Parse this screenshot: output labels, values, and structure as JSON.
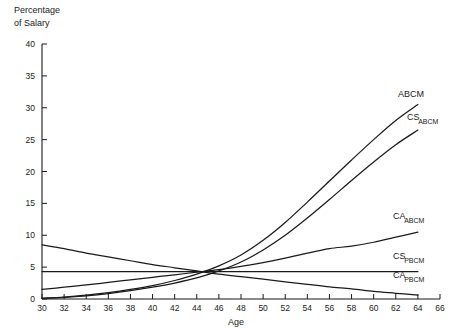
{
  "chart_data": {
    "type": "line",
    "title": "",
    "xlabel": "Age",
    "ylabel": "Percentage of Salary",
    "ylabel_line1": "Percentage",
    "ylabel_line2": "of Salary",
    "xlim": [
      30,
      66
    ],
    "ylim": [
      0,
      40
    ],
    "xticks": [
      30,
      32,
      34,
      36,
      38,
      40,
      42,
      44,
      46,
      48,
      50,
      52,
      54,
      56,
      58,
      60,
      62,
      64,
      66
    ],
    "yticks": [
      0,
      5,
      10,
      15,
      20,
      25,
      30,
      35,
      40
    ],
    "grid": false,
    "legend_position": "right-inline-labels",
    "x": [
      30,
      32,
      34,
      36,
      38,
      40,
      42,
      44,
      46,
      48,
      50,
      52,
      54,
      56,
      58,
      60,
      62,
      64
    ],
    "series": [
      {
        "name": "ABCM",
        "label_main": "ABCM",
        "label_sub": "",
        "label_x": 398,
        "label_y": 97,
        "values": [
          0.1,
          0.3,
          0.6,
          1.0,
          1.5,
          2.1,
          2.9,
          3.9,
          5.2,
          6.9,
          9.2,
          12.0,
          15.2,
          18.5,
          21.8,
          25.0,
          28.0,
          30.5
        ]
      },
      {
        "name": "CS_ABCM",
        "label_main": "CS",
        "label_sub": "ABCM",
        "label_x": 407,
        "label_y": 120,
        "values": [
          0.1,
          0.25,
          0.5,
          0.85,
          1.3,
          1.85,
          2.5,
          3.3,
          4.4,
          5.8,
          7.7,
          10.0,
          12.7,
          15.6,
          18.6,
          21.5,
          24.2,
          26.5
        ]
      },
      {
        "name": "CA_ABCM",
        "label_main": "CA",
        "label_sub": "ABCM",
        "label_x": 393,
        "label_y": 219,
        "values": [
          1.5,
          1.85,
          2.2,
          2.6,
          3.0,
          3.4,
          3.8,
          4.2,
          4.6,
          5.1,
          5.7,
          6.4,
          7.2,
          7.9,
          8.3,
          8.9,
          9.7,
          10.5
        ]
      },
      {
        "name": "CS_PBCM",
        "label_main": "CS",
        "label_sub": "PBCM",
        "label_x": 393,
        "label_y": 259,
        "values": [
          4.3,
          4.3,
          4.3,
          4.3,
          4.3,
          4.3,
          4.3,
          4.3,
          4.3,
          4.3,
          4.3,
          4.3,
          4.3,
          4.3,
          4.3,
          4.3,
          4.3,
          4.3
        ]
      },
      {
        "name": "CA_PBCM",
        "label_main": "CA",
        "label_sub": "PBCM",
        "label_x": 393,
        "label_y": 278,
        "values": [
          8.5,
          7.9,
          7.2,
          6.6,
          6.0,
          5.4,
          4.9,
          4.4,
          3.9,
          3.5,
          3.1,
          2.7,
          2.3,
          1.9,
          1.6,
          1.2,
          0.9,
          0.6
        ]
      }
    ]
  }
}
